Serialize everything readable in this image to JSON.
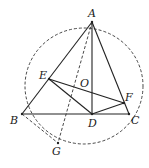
{
  "diagram": {
    "type": "geometry",
    "points": {
      "A": {
        "label": "A",
        "x": 92,
        "y": 22
      },
      "B": {
        "label": "B",
        "x": 22,
        "y": 114
      },
      "C": {
        "label": "C",
        "x": 129,
        "y": 114
      },
      "D": {
        "label": "D",
        "x": 92,
        "y": 114
      },
      "E": {
        "label": "E",
        "x": 49,
        "y": 79
      },
      "F": {
        "label": "F",
        "x": 124,
        "y": 103
      },
      "G": {
        "label": "G",
        "x": 58,
        "y": 143
      },
      "O": {
        "label": "O",
        "x": 79,
        "y": 84
      }
    },
    "solid_segments": [
      "AB",
      "AC",
      "BC",
      "AD",
      "EF",
      "ED",
      "DF"
    ],
    "dashed_segments": [
      "AG",
      "BG"
    ],
    "circle": {
      "cx": 84,
      "cy": 86,
      "rx": 59,
      "ry": 58,
      "style": "dashed"
    }
  }
}
